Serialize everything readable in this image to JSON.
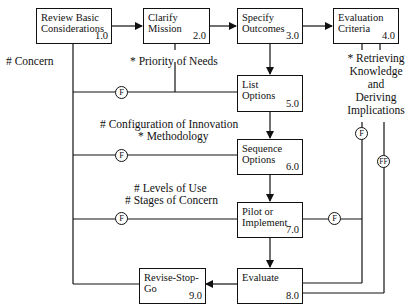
{
  "diagram": {
    "title": "",
    "nodes": [
      {
        "id": "1.0",
        "label": "Review Basic\nConsiderations",
        "number": "1.0"
      },
      {
        "id": "2.0",
        "label": "Clarify\nMission",
        "number": "2.0"
      },
      {
        "id": "3.0",
        "label": "Specify\nOutcomes",
        "number": "3.0"
      },
      {
        "id": "4.0",
        "label": "Evaluation\nCriteria",
        "number": "4.0"
      },
      {
        "id": "5.0",
        "label": "List\nOptions",
        "number": "5.0"
      },
      {
        "id": "6.0",
        "label": "Sequence\nOptions",
        "number": "6.0"
      },
      {
        "id": "7.0",
        "label": "Pilot or\nImplement",
        "number": "7.0"
      },
      {
        "id": "8.0",
        "label": "Evaluate",
        "number": "8.0"
      },
      {
        "id": "9.0",
        "label": "Revise-Stop-Go",
        "number": "9.0"
      }
    ],
    "annotations": {
      "concern": "# Concern",
      "priority": "* Priority of Needs",
      "configuration": "# Configuration of Innovation",
      "methodology": "* Methodology",
      "levels": "# Levels of Use",
      "stages": "# Stages of Concern",
      "retrieving_1": "* Retrieving",
      "retrieving_2": "Knowledge",
      "retrieving_3": "and",
      "retrieving_4": "Deriving",
      "retrieving_5": "Implications"
    },
    "feedback_markers": {
      "f1": "F",
      "f2": "F",
      "f3": "F",
      "f4": "F",
      "f5": "F",
      "ff": "FF"
    },
    "edges": [
      {
        "from": "1.0",
        "to": "2.0"
      },
      {
        "from": "2.0",
        "to": "3.0"
      },
      {
        "from": "3.0",
        "to": "4.0"
      },
      {
        "from": "3.0",
        "to": "5.0"
      },
      {
        "from": "5.0",
        "to": "6.0"
      },
      {
        "from": "6.0",
        "to": "7.0"
      },
      {
        "from": "7.0",
        "to": "8.0"
      },
      {
        "from": "8.0",
        "to": "9.0"
      }
    ],
    "line_color": "#111111"
  }
}
